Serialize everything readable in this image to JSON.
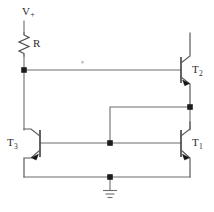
{
  "diagram": {
    "type": "electronic-schematic",
    "background_color": "#ffffff",
    "wire_color": "#6d6d6d",
    "node_color": "#1c1c1c",
    "label_color": "#2a2a2a"
  },
  "labels": {
    "supply": "V",
    "supply_sign": "+",
    "resistor": "R",
    "t1_name": "T",
    "t1_index": "1",
    "t2_name": "T",
    "t2_index": "2",
    "t3_name": "T",
    "t3_index": "3"
  },
  "components": [
    {
      "id": "supply-terminal",
      "name": "V+",
      "kind": "terminal",
      "position": {
        "x": 24,
        "y": 18
      }
    },
    {
      "id": "resistor-r",
      "name": "R",
      "kind": "resistor",
      "position": {
        "x": 24,
        "y": 43
      },
      "orientation": "vertical"
    },
    {
      "id": "transistor-t2",
      "name": "T2",
      "kind": "bjt",
      "position": {
        "x": 181,
        "y": 70
      },
      "orientation": "base-left"
    },
    {
      "id": "transistor-t3",
      "name": "T3",
      "kind": "bjt",
      "position": {
        "x": 40,
        "y": 143
      },
      "orientation": "base-left"
    },
    {
      "id": "transistor-t1",
      "name": "T1",
      "kind": "bjt",
      "position": {
        "x": 181,
        "y": 143
      },
      "orientation": "base-left"
    },
    {
      "id": "ground-symbol",
      "name": "GND",
      "kind": "ground",
      "position": {
        "x": 110,
        "y": 188
      }
    }
  ],
  "nodes": [
    {
      "id": "node-top-left",
      "x": 24,
      "y": 70,
      "label": ""
    },
    {
      "id": "node-right-mid",
      "x": 190,
      "y": 107,
      "label": ""
    },
    {
      "id": "node-base-mid",
      "x": 110,
      "y": 143,
      "label": ""
    },
    {
      "id": "node-ground",
      "x": 110,
      "y": 177,
      "label": ""
    }
  ]
}
